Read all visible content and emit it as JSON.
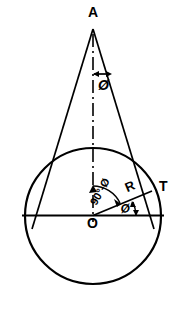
{
  "figure": {
    "stroke_color": "#000000",
    "background_color": "#ffffff",
    "width": 186,
    "height": 311
  },
  "points": {
    "apex": {
      "label": "A",
      "x": 93,
      "y": 28
    },
    "center": {
      "label": "O",
      "x": 93,
      "y": 216
    },
    "tangent_point": {
      "label": "T",
      "x": 148,
      "y": 194
    }
  },
  "circle": {
    "center_x": 93,
    "center_y": 216,
    "radius": 68
  },
  "labels": {
    "apex_angle": "Ø",
    "center_angle": "Ø",
    "complement_angle": "90°-Ø",
    "radius": "R"
  },
  "elements": {
    "centerline_style": "dash-dot",
    "diameter_line": "horizontal",
    "tangent_lines": 2,
    "angle_arc_apex": true,
    "angle_arc_center": true
  }
}
